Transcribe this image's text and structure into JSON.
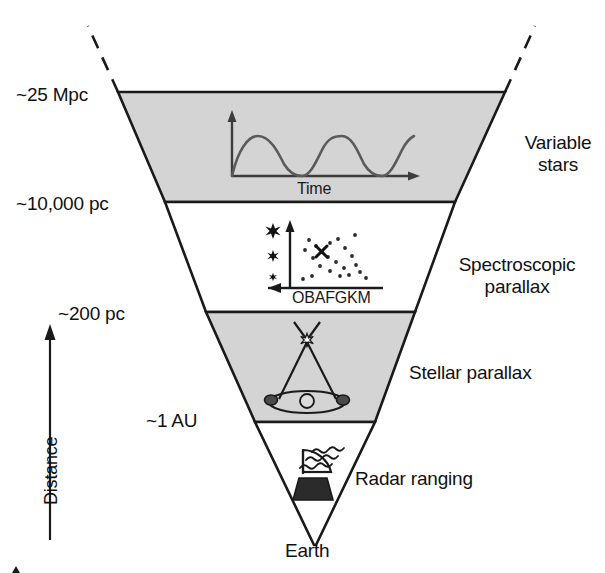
{
  "figure": {
    "apex_label": "Earth",
    "vertical_axis_label": "Distance",
    "colors": {
      "band_fill": "#d4d4d4",
      "outline": "#1a1a1a",
      "curve": "#5a5a5a",
      "background": "#ffffff"
    }
  },
  "distance_scale": {
    "items": [
      {
        "label": "~25 Mpc",
        "value": 25,
        "unit": "Mpc",
        "y": 96
      },
      {
        "label": "~10,000 pc",
        "value": 10000,
        "unit": "pc",
        "y": 205
      },
      {
        "label": "~200 pc",
        "value": 200,
        "unit": "pc",
        "y": 315
      },
      {
        "label": "~1 AU",
        "value": 1,
        "unit": "AU",
        "y": 421
      }
    ]
  },
  "methods": {
    "items": [
      {
        "name": "variable-stars",
        "lines": [
          "Variable",
          "stars"
        ]
      },
      {
        "name": "spectroscopic-parallax",
        "lines": [
          "Spectroscopic",
          "parallax"
        ]
      },
      {
        "name": "stellar-parallax",
        "lines": [
          "Stellar parallax"
        ]
      },
      {
        "name": "radar-ranging",
        "lines": [
          "Radar ranging"
        ]
      }
    ],
    "variable_stars_line1": "Variable",
    "variable_stars_line2": "stars",
    "spectroscopic_line1": "Spectroscopic",
    "spectroscopic_line2": "parallax",
    "stellar_parallax": "Stellar parallax",
    "radar_ranging": "Radar ranging"
  },
  "insets": {
    "light_curve": {
      "name": "variable-star-light-curve",
      "x_axis_label": "Time",
      "y_axis_label": "",
      "cycles": 2.5,
      "description": "periodic brightness curve"
    },
    "hr_diagram": {
      "name": "hertzsprung-russell-diagram",
      "x_axis_label": "OBAFGKM",
      "spectral_classes": [
        "O",
        "B",
        "A",
        "F",
        "G",
        "K",
        "M"
      ],
      "luminosity_markers": 3,
      "marked_star": "X",
      "scatter_points": 22
    },
    "parallax": {
      "name": "stellar-parallax-geometry",
      "description": "star sighted from two points of Earth's orbit around the Sun"
    },
    "radar": {
      "name": "radar-dish",
      "description": "radar dish emitting waves"
    }
  }
}
